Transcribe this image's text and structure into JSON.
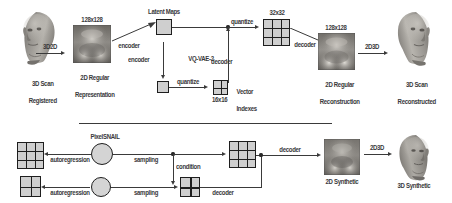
{
  "figure": {
    "divider": true
  },
  "colors": {
    "ink": "#2b2b2b",
    "line": "#3a3a3a",
    "grid_fill": "#cfcfcf",
    "grid_stroke": "#1e1e1e",
    "node_fill": "#d4d4d4",
    "background": "#ffffff"
  },
  "top_row": {
    "stage_scan": {
      "caption_line1": "3D Scan",
      "caption_line2": "Registered",
      "icon": "head-mesh-left-facing"
    },
    "arrow_3d2d": {
      "label": "3D2D"
    },
    "stage_regular": {
      "size_label": "128x128",
      "caption_line1": "2D Regular",
      "caption_line2": "Representation",
      "icon": "uv-texture-map"
    },
    "encoder_top": {
      "label": "encoder"
    },
    "encoder_bottom": {
      "label": "encoder"
    },
    "latent_maps": {
      "label": "Latent Maps",
      "icon": "latent-square-top"
    },
    "latent_small": {
      "icon": "latent-square-bottom"
    },
    "model_name": "VQ-VAE-2",
    "quantize_top": {
      "label": "quantize"
    },
    "quantize_bottom": {
      "label": "quantize"
    },
    "vector_indexes": {
      "label_line1": "Vector",
      "label_line2": "Indexes",
      "size_label": "16x16",
      "icon": "index-grid-2x2"
    },
    "codes_top": {
      "size_label": "32x32",
      "icon": "index-grid-3x3"
    },
    "decoder_top": {
      "label": "decoder"
    },
    "decoder_side": {
      "label": "decoder"
    },
    "stage_reconstruction": {
      "size_label": "128x128",
      "caption_line1": "2D Regular",
      "caption_line2": "Reconstruction",
      "icon": "uv-texture-map"
    },
    "arrow_2d3d": {
      "label": "2D3D"
    },
    "stage_scan_recon": {
      "caption_line1": "3D Scan",
      "caption_line2": "Reconstructed",
      "icon": "head-mesh-right-facing"
    }
  },
  "bottom_row": {
    "codes_top": {
      "icon": "index-grid-3x3"
    },
    "codes_bottom": {
      "icon": "index-grid-2x2"
    },
    "autoregression_top": {
      "label": "autoregression"
    },
    "autoregression_bottom": {
      "label": "autoregression"
    },
    "model_name": "PixelSNAIL",
    "node_top": {
      "icon": "pixelsnail-node-top"
    },
    "node_bottom": {
      "icon": "pixelsnail-node-bottom"
    },
    "sampling_top": {
      "label": "sampling"
    },
    "sampling_bottom": {
      "label": "sampling"
    },
    "condition": {
      "label": "condition"
    },
    "sampled_bottom": {
      "icon": "index-grid-2x2"
    },
    "sampled_top": {
      "icon": "index-grid-3x3"
    },
    "decoder_inner": {
      "label": "decoder"
    },
    "decoder_out": {
      "label": "decoder"
    },
    "stage_synthetic_2d": {
      "caption": "2D Synthetic",
      "icon": "uv-texture-map"
    },
    "arrow_2d3d": {
      "label": "2D3D"
    },
    "stage_synthetic_3d": {
      "caption": "3D Synthetic",
      "icon": "head-mesh-right-facing"
    }
  }
}
